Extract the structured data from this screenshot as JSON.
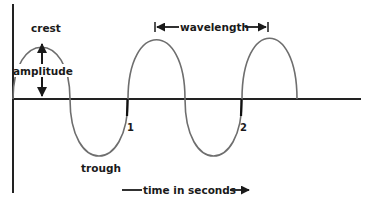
{
  "diagram": {
    "type": "transverse-wave",
    "labels": {
      "crest": "crest",
      "amplitude": "amplitude",
      "trough": "trough",
      "wavelength": "wavelength",
      "time_axis": "time in seconds",
      "marker_1": "1",
      "marker_2": "2"
    },
    "colors": {
      "wave": "#6e6e6e",
      "axis": "#222222",
      "text": "#1a1a1a",
      "background": "#ffffff"
    },
    "wave": {
      "crests_x": [
        42,
        156,
        269
      ],
      "troughs_x": [
        99,
        213
      ],
      "crest_y": 40,
      "trough_y": 156,
      "baseline_y": 99,
      "zero_crossings_x": [
        70,
        128,
        185,
        242,
        297
      ]
    },
    "axes": {
      "vertical": {
        "x": 13,
        "y_top": 4,
        "y_bottom": 193
      },
      "horizontal": {
        "y": 99,
        "x_left": 13,
        "x_right": 361
      }
    }
  }
}
